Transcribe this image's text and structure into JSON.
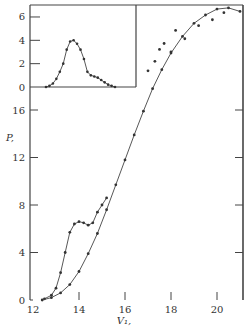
{
  "chart_data": [
    {
      "type": "line",
      "role": "main",
      "title": "",
      "xlabel": "V₁,",
      "ylabel": "P,",
      "xlim": [
        11.9,
        21.1
      ],
      "ylim": [
        0,
        20
      ],
      "xticks": [
        12,
        14,
        16,
        18,
        20
      ],
      "yticks": [
        0,
        4,
        8,
        12,
        16
      ],
      "grid": false,
      "legend": null,
      "series": [
        {
          "name": "curve-with-hump",
          "style": "solid line with dots",
          "x": [
            12.5,
            12.8,
            13.0,
            13.2,
            13.4,
            13.6,
            13.8,
            14.0,
            14.2,
            14.4,
            14.6,
            14.8,
            15.0,
            15.2
          ],
          "y": [
            0.1,
            0.4,
            1.0,
            2.3,
            4.0,
            5.7,
            6.4,
            6.6,
            6.5,
            6.3,
            6.5,
            7.4,
            8.0,
            8.6
          ]
        },
        {
          "name": "smooth-curve",
          "style": "solid line with dots",
          "x": [
            12.4,
            12.8,
            13.2,
            13.6,
            14.0,
            14.4,
            14.8,
            15.2,
            15.6,
            16.0,
            16.4,
            16.8,
            17.2,
            17.6,
            18.0,
            18.5,
            19.0,
            19.5,
            20.0,
            20.5,
            21.0
          ],
          "y": [
            0.0,
            0.2,
            0.6,
            1.3,
            2.4,
            3.9,
            5.6,
            7.6,
            9.7,
            11.8,
            13.9,
            15.9,
            17.8,
            19.4,
            20.8,
            22.2,
            23.3,
            24.0,
            24.5,
            24.6,
            24.3
          ]
        },
        {
          "name": "upper-scattered-points",
          "style": "dots",
          "x": [
            17.0,
            17.3,
            17.5,
            17.7,
            18.0,
            18.2,
            18.6,
            19.2,
            19.8,
            20.3
          ],
          "y": [
            19.3,
            20.1,
            21.1,
            21.6,
            20.9,
            22.7,
            22.0,
            23.1,
            23.6,
            24.2
          ]
        }
      ]
    },
    {
      "type": "line",
      "role": "inset",
      "title": "",
      "xlabel": "",
      "ylabel": "",
      "ylim": [
        0,
        7
      ],
      "yticks": [
        0,
        2,
        4,
        6
      ],
      "grid": false,
      "series": [
        {
          "name": "inset-peak",
          "style": "solid line with dots",
          "x": [
            0.0,
            0.05,
            0.1,
            0.15,
            0.2,
            0.25,
            0.3,
            0.35,
            0.4,
            0.45,
            0.5,
            0.55,
            0.6,
            0.65,
            0.7,
            0.75,
            0.8,
            0.85,
            0.9,
            0.95,
            1.0
          ],
          "y": [
            0.0,
            0.1,
            0.3,
            0.7,
            1.3,
            2.0,
            3.2,
            3.9,
            4.0,
            3.7,
            3.2,
            2.4,
            1.3,
            1.0,
            0.9,
            0.8,
            0.6,
            0.4,
            0.2,
            0.1,
            0.0
          ]
        }
      ]
    }
  ],
  "labels": {
    "xlabel": "V₁,",
    "ylabel": "P,",
    "x_ticks": [
      "12",
      "14",
      "16",
      "18",
      "20"
    ],
    "y_ticks": [
      "0",
      "4",
      "8",
      "12",
      "16"
    ],
    "inset_y_ticks": [
      "0",
      "2",
      "4",
      "6"
    ]
  }
}
